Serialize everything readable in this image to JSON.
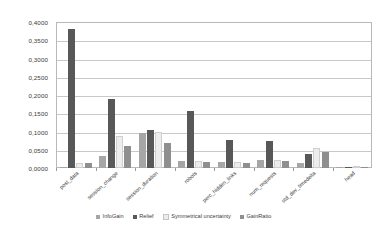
{
  "chart_data": {
    "type": "bar",
    "title": "",
    "subtitle": "",
    "xlabel": "",
    "ylabel": "",
    "ylim": [
      0,
      0.4
    ],
    "ytick_step": 0.05,
    "grid": true,
    "decimal_separator": ",",
    "legend_position": "bottom",
    "categories": [
      "post_data",
      "session_change",
      "session_duration",
      "robots",
      "perc_hidden_links",
      "num_requests",
      "std_dev_timedelta",
      "head"
    ],
    "ytick_labels": [
      "0,4000",
      "0,3500",
      "0,3000",
      "0,2500",
      "0,2000",
      "0,1500",
      "0,1000",
      "0,0500",
      "0,0000"
    ],
    "ytick_values": [
      0.4,
      0.35,
      0.3,
      0.25,
      0.2,
      0.15,
      0.1,
      0.05,
      0.0
    ],
    "series": [
      {
        "name": "InfoGain",
        "color": "#a6a6a6",
        "values": [
          0.004,
          0.033,
          0.096,
          0.02,
          0.0165,
          0.0215,
          0.015,
          0.0005
        ]
      },
      {
        "name": "Relief",
        "color": "#585858",
        "values": [
          0.381,
          0.19,
          0.105,
          0.155,
          0.076,
          0.075,
          0.039,
          0.0005
        ]
      },
      {
        "name": "Symmetrical uncertainty",
        "color": "#ededed",
        "values": [
          0.013,
          0.087,
          0.0995,
          0.019,
          0.0155,
          0.021,
          0.0545,
          0.0005
        ]
      },
      {
        "name": "GainRatio",
        "color": "#8f8f8f",
        "values": [
          0.0125,
          0.059,
          0.068,
          0.017,
          0.0145,
          0.0195,
          0.043,
          0.0005
        ]
      }
    ]
  },
  "colors": {
    "plot_border": "#b9b9b9",
    "gridline": "#c8c8c8",
    "background": "#ffffff",
    "text": "#3d3d3d"
  }
}
